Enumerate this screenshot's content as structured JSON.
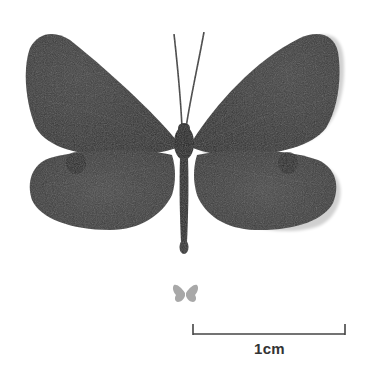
{
  "specimen": {
    "subject": "butterfly",
    "view": "dorsal",
    "colors": {
      "wing": "#3f3f3f",
      "wing_dark": "#2c2c2c",
      "body": "#262626",
      "background": "#ffffff",
      "miniature": "#9a9a9a",
      "scale_bar": "#444444"
    }
  },
  "scale_bar": {
    "label": "1cm"
  }
}
